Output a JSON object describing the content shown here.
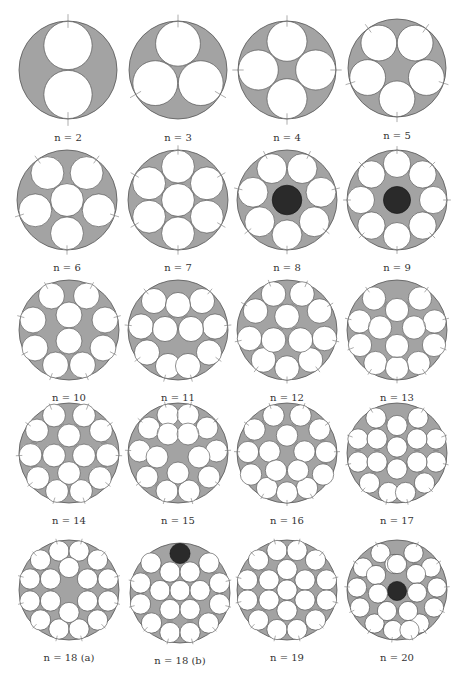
{
  "figure": {
    "colors": {
      "outer_fill": "#a3a3a3",
      "outer_stroke": "#555555",
      "inner_fill": "#ffffff",
      "inner_stroke": "#444444",
      "dark_fill": "#2a2a2a",
      "tick": "#777777"
    },
    "panels": [
      {
        "label": "n = 2",
        "cx": 68,
        "cy": 70,
        "R": 49,
        "r": 0.5,
        "circles": [
          [
            0,
            -0.5
          ],
          [
            0,
            0.5
          ]
        ],
        "dark": []
      },
      {
        "label": "n = 3",
        "cx": 178,
        "cy": 70,
        "R": 49,
        "r": 0.4641,
        "circles": [
          [
            0,
            -0.5359
          ],
          [
            -0.4641,
            0.268
          ],
          [
            0.4641,
            0.268
          ]
        ],
        "dark": []
      },
      {
        "label": "n = 4",
        "cx": 287,
        "cy": 70,
        "R": 49,
        "r": 0.4142,
        "circles": [
          [
            0,
            -0.5858
          ],
          [
            -0.5858,
            0
          ],
          [
            0.5858,
            0
          ],
          [
            0,
            0.5858
          ]
        ],
        "dark": []
      },
      {
        "label": "n = 5",
        "cx": 397,
        "cy": 68,
        "R": 49,
        "r": 0.3702,
        "circles": [
          [
            -0.37,
            -0.5095
          ],
          [
            0.37,
            -0.5095
          ],
          [
            -0.599,
            0.1946
          ],
          [
            0.599,
            0.1946
          ],
          [
            0,
            0.6298
          ]
        ],
        "dark": []
      },
      {
        "label": "n = 6",
        "cx": 67,
        "cy": 200,
        "R": 50,
        "r": 0.3333,
        "circles": [
          [
            -0.3918,
            -0.5393
          ],
          [
            0.3918,
            -0.5393
          ],
          [
            -0.634,
            0.206
          ],
          [
            0.634,
            0.206
          ],
          [
            0,
            0.6667
          ],
          [
            0,
            0
          ]
        ],
        "dark": []
      },
      {
        "label": "n = 7",
        "cx": 178,
        "cy": 200,
        "R": 50,
        "r": 0.3333,
        "circles": [
          [
            0,
            0
          ],
          [
            0,
            -0.6667
          ],
          [
            0,
            0.6667
          ],
          [
            -0.5774,
            -0.3333
          ],
          [
            0.5774,
            -0.3333
          ],
          [
            -0.5774,
            0.3333
          ],
          [
            0.5774,
            0.3333
          ]
        ],
        "dark": []
      },
      {
        "label": "n = 8",
        "cx": 287,
        "cy": 200,
        "R": 50,
        "r": 0.3026,
        "circles": [
          [
            -0.3026,
            -0.6284
          ],
          [
            0.3026,
            -0.6284
          ],
          [
            -0.68,
            -0.1552
          ],
          [
            0.68,
            -0.1552
          ],
          [
            -0.5453,
            0.4349
          ],
          [
            0.5453,
            0.4349
          ],
          [
            0,
            0.6974
          ]
        ],
        "dark": [
          [
            0,
            0,
            0.3026
          ]
        ]
      },
      {
        "label": "n = 9",
        "cx": 397,
        "cy": 200,
        "R": 50,
        "r": 0.2768,
        "circles": [
          [
            0,
            -0.7232
          ],
          [
            0,
            0.7232
          ],
          [
            -0.7232,
            0
          ],
          [
            0.7232,
            0
          ],
          [
            -0.5114,
            -0.5114
          ],
          [
            0.5114,
            -0.5114
          ],
          [
            -0.5114,
            0.5114
          ],
          [
            0.5114,
            0.5114
          ]
        ],
        "dark": [
          [
            0,
            0,
            0.2768
          ]
        ]
      },
      {
        "label": "n = 10",
        "cx": 69,
        "cy": 330,
        "R": 50,
        "r": 0.2623,
        "circles": [
          [
            -0.35,
            -0.68
          ],
          [
            0.35,
            -0.68
          ],
          [
            -0.72,
            -0.2
          ],
          [
            0.72,
            -0.2
          ],
          [
            -0.68,
            0.36
          ],
          [
            0.68,
            0.36
          ],
          [
            -0.27,
            0.7
          ],
          [
            0.27,
            0.7
          ],
          [
            0,
            -0.3
          ],
          [
            0,
            0.22
          ]
        ],
        "dark": []
      },
      {
        "label": "n = 11",
        "cx": 178,
        "cy": 330,
        "R": 50,
        "r": 0.2548,
        "circles": [
          [
            -0.48,
            -0.58
          ],
          [
            0.48,
            -0.58
          ],
          [
            -0.74,
            -0.07
          ],
          [
            0.74,
            -0.07
          ],
          [
            -0.62,
            0.45
          ],
          [
            0.62,
            0.45
          ],
          [
            -0.2,
            0.72
          ],
          [
            0.2,
            0.72
          ],
          [
            0,
            -0.5
          ],
          [
            -0.26,
            -0.02
          ],
          [
            0.26,
            -0.02
          ]
        ],
        "dark": []
      },
      {
        "label": "n = 12",
        "cx": 287,
        "cy": 330,
        "R": 50,
        "r": 0.2487,
        "circles": [
          [
            -0.27,
            -0.72
          ],
          [
            0.3,
            -0.72
          ],
          [
            -0.63,
            -0.38
          ],
          [
            0.65,
            -0.38
          ],
          [
            -0.75,
            0.17
          ],
          [
            0.75,
            0.17
          ],
          [
            -0.47,
            0.6
          ],
          [
            0.47,
            0.6
          ],
          [
            0,
            0.76
          ],
          [
            0,
            -0.27
          ],
          [
            -0.27,
            0.2
          ],
          [
            0.27,
            0.2
          ]
        ],
        "dark": []
      },
      {
        "label": "n = 13",
        "cx": 397,
        "cy": 330,
        "R": 50,
        "r": 0.2361,
        "circles": [
          [
            -0.46,
            -0.63
          ],
          [
            0.46,
            -0.63
          ],
          [
            -0.75,
            -0.17
          ],
          [
            0.75,
            -0.17
          ],
          [
            -0.74,
            0.3
          ],
          [
            0.74,
            0.3
          ],
          [
            -0.43,
            0.66
          ],
          [
            0.43,
            0.66
          ],
          [
            0,
            0.76
          ],
          [
            0,
            -0.4
          ],
          [
            -0.34,
            -0.05
          ],
          [
            0.34,
            -0.05
          ],
          [
            0,
            0.32
          ]
        ],
        "dark": []
      },
      {
        "label": "n = 14",
        "cx": 69,
        "cy": 453,
        "R": 50,
        "r": 0.231,
        "circles": [
          [
            -0.3,
            -0.75
          ],
          [
            0.3,
            -0.75
          ],
          [
            -0.64,
            -0.45
          ],
          [
            0.64,
            -0.45
          ],
          [
            -0.77,
            0.04
          ],
          [
            0.77,
            0.04
          ],
          [
            -0.62,
            0.5
          ],
          [
            0.62,
            0.5
          ],
          [
            -0.24,
            0.76
          ],
          [
            0.24,
            0.76
          ],
          [
            0,
            -0.35
          ],
          [
            -0.3,
            0.05
          ],
          [
            0.3,
            0.05
          ],
          [
            0,
            0.4
          ]
        ],
        "dark": []
      },
      {
        "label": "n = 15",
        "cx": 178,
        "cy": 453,
        "R": 50,
        "r": 0.2219,
        "circles": [
          [
            -0.2,
            -0.76
          ],
          [
            0.2,
            -0.76
          ],
          [
            -0.58,
            -0.5
          ],
          [
            0.58,
            -0.5
          ],
          [
            -0.77,
            -0.04
          ],
          [
            0.77,
            -0.04
          ],
          [
            -0.62,
            0.48
          ],
          [
            0.62,
            0.48
          ],
          [
            -0.22,
            0.76
          ],
          [
            0.22,
            0.76
          ],
          [
            -0.2,
            -0.38
          ],
          [
            0.2,
            -0.38
          ],
          [
            -0.42,
            0.08
          ],
          [
            0.42,
            0.08
          ],
          [
            0,
            0.4
          ]
        ],
        "dark": []
      },
      {
        "label": "n = 16",
        "cx": 287,
        "cy": 453,
        "R": 50,
        "r": 0.2166,
        "circles": [
          [
            -0.27,
            -0.75
          ],
          [
            0.27,
            -0.75
          ],
          [
            -0.65,
            -0.47
          ],
          [
            0.65,
            -0.47
          ],
          [
            -0.78,
            -0.02
          ],
          [
            0.78,
            -0.02
          ],
          [
            -0.72,
            0.43
          ],
          [
            0.72,
            0.43
          ],
          [
            -0.4,
            0.7
          ],
          [
            0.4,
            0.7
          ],
          [
            0,
            0.79
          ],
          [
            0,
            -0.35
          ],
          [
            -0.35,
            -0.03
          ],
          [
            0.35,
            -0.03
          ],
          [
            -0.22,
            0.35
          ],
          [
            0.22,
            0.35
          ]
        ],
        "dark": []
      },
      {
        "label": "n = 17",
        "cx": 397,
        "cy": 453,
        "R": 50,
        "r": 0.2056,
        "circles": [
          [
            -0.42,
            -0.7
          ],
          [
            0.42,
            -0.7
          ],
          [
            -0.78,
            -0.28
          ],
          [
            0.78,
            -0.28
          ],
          [
            -0.78,
            0.18
          ],
          [
            0.78,
            0.18
          ],
          [
            -0.55,
            0.6
          ],
          [
            0.55,
            0.6
          ],
          [
            -0.17,
            0.79
          ],
          [
            0.17,
            0.79
          ],
          [
            0,
            -0.55
          ],
          [
            -0.4,
            -0.28
          ],
          [
            0.4,
            -0.28
          ],
          [
            0,
            -0.12
          ],
          [
            -0.4,
            0.18
          ],
          [
            0.4,
            0.18
          ],
          [
            0,
            0.32
          ]
        ],
        "dark": []
      },
      {
        "label": "n = 18 (a)",
        "cx": 69,
        "cy": 590,
        "R": 50,
        "r": 0.2056,
        "circles": [
          [
            -0.2,
            -0.78
          ],
          [
            0.2,
            -0.78
          ],
          [
            -0.57,
            -0.6
          ],
          [
            0.57,
            -0.6
          ],
          [
            -0.78,
            -0.22
          ],
          [
            0.78,
            -0.22
          ],
          [
            -0.78,
            0.22
          ],
          [
            0.78,
            0.22
          ],
          [
            -0.57,
            0.6
          ],
          [
            0.57,
            0.6
          ],
          [
            -0.2,
            0.78
          ],
          [
            0.2,
            0.78
          ],
          [
            0,
            -0.45
          ],
          [
            -0.37,
            -0.22
          ],
          [
            0.37,
            -0.22
          ],
          [
            -0.37,
            0.22
          ],
          [
            0.37,
            0.22
          ],
          [
            0,
            0.45
          ]
        ],
        "dark": []
      },
      {
        "label": "n = 18 (b)",
        "cx": 180,
        "cy": 593,
        "R": 50,
        "r": 0.2056,
        "circles": [
          [
            -0.58,
            -0.6
          ],
          [
            0.58,
            -0.6
          ],
          [
            -0.79,
            -0.2
          ],
          [
            0.79,
            -0.2
          ],
          [
            -0.79,
            0.22
          ],
          [
            0.79,
            0.22
          ],
          [
            -0.57,
            0.6
          ],
          [
            0.57,
            0.6
          ],
          [
            -0.2,
            0.79
          ],
          [
            0.2,
            0.79
          ],
          [
            -0.2,
            -0.42
          ],
          [
            0.2,
            -0.42
          ],
          [
            -0.4,
            -0.05
          ],
          [
            0,
            -0.05
          ],
          [
            0.4,
            -0.05
          ],
          [
            -0.2,
            0.33
          ],
          [
            0.2,
            0.33
          ]
        ],
        "dark": [
          [
            0,
            -0.79,
            0.2056
          ]
        ]
      },
      {
        "label": "n = 19",
        "cx": 287,
        "cy": 590,
        "R": 50,
        "r": 0.2056,
        "circles": [
          [
            -0.2,
            -0.79
          ],
          [
            0.2,
            -0.79
          ],
          [
            -0.57,
            -0.6
          ],
          [
            0.57,
            -0.6
          ],
          [
            -0.79,
            -0.2
          ],
          [
            0.79,
            -0.2
          ],
          [
            -0.79,
            0.2
          ],
          [
            0.79,
            0.2
          ],
          [
            -0.57,
            0.6
          ],
          [
            0.57,
            0.6
          ],
          [
            -0.2,
            0.79
          ],
          [
            0.2,
            0.79
          ],
          [
            0,
            -0.41
          ],
          [
            -0.36,
            -0.2
          ],
          [
            0.36,
            -0.2
          ],
          [
            0,
            0
          ],
          [
            -0.36,
            0.2
          ],
          [
            0.36,
            0.2
          ],
          [
            0,
            0.41
          ]
        ],
        "dark": []
      },
      {
        "label": "n = 20",
        "cx": 397,
        "cy": 590,
        "R": 50,
        "r": 0.1952,
        "circles": [
          [
            -0.33,
            -0.74
          ],
          [
            0.33,
            -0.74
          ],
          [
            -0.68,
            -0.45
          ],
          [
            0.68,
            -0.45
          ],
          [
            -0.8,
            -0.05
          ],
          [
            0.8,
            -0.05
          ],
          [
            -0.74,
            0.35
          ],
          [
            0.74,
            0.35
          ],
          [
            -0.45,
            0.67
          ],
          [
            0.45,
            0.67
          ],
          [
            -0.08,
            0.8
          ],
          [
            0.25,
            0.8
          ],
          [
            -0.05,
            -0.52
          ],
          [
            -0.42,
            -0.3
          ],
          [
            0.38,
            -0.32
          ],
          [
            -0.38,
            0.07
          ],
          [
            0.4,
            0.05
          ],
          [
            -0.2,
            0.42
          ],
          [
            0.22,
            0.42
          ],
          [
            0,
            -0.52
          ]
        ],
        "dark": [
          [
            0,
            0.02,
            0.1952
          ]
        ]
      }
    ],
    "caption": "..."
  }
}
